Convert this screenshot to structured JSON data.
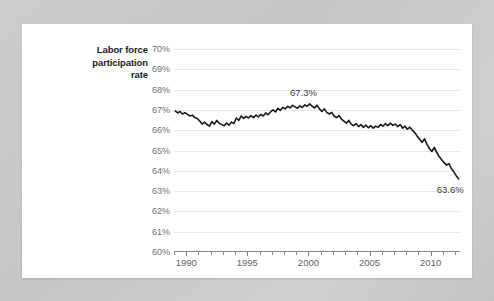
{
  "card": {
    "background_color": "#ffffff",
    "page_background_color": "#c9c9c9"
  },
  "chart_data": {
    "type": "line",
    "title": "Labor force participation rate",
    "title_lines": [
      "Labor force",
      "participation",
      "rate"
    ],
    "xlabel": "",
    "ylabel": "",
    "xlim": [
      1989.0,
      2012.4
    ],
    "ylim": [
      60,
      70
    ],
    "grid": true,
    "legend": "none",
    "line_color": "#1a1a1a",
    "grid_color": "#e9e9e9",
    "axis_color": "#8a8a8a",
    "ytick_labels": [
      "70%",
      "69%",
      "68%",
      "67%",
      "66%",
      "65%",
      "64%",
      "63%",
      "62%",
      "61%",
      "60%"
    ],
    "ytick_values": [
      70,
      69,
      68,
      67,
      66,
      65,
      64,
      63,
      62,
      61,
      60
    ],
    "xtick_labels": [
      "1990",
      "1995",
      "2000",
      "2005",
      "2010"
    ],
    "xtick_values": [
      1990,
      1995,
      2000,
      2005,
      2010
    ],
    "xtick_minor_values": [
      1989,
      1991,
      1992,
      1993,
      1994,
      1996,
      1997,
      1998,
      1999,
      2001,
      2002,
      2003,
      2004,
      2006,
      2007,
      2008,
      2009,
      2011,
      2012
    ],
    "annotations": [
      {
        "name": "peak-label",
        "text": "67.3%",
        "x": 1999.6,
        "y": 67.85
      },
      {
        "name": "end-label",
        "text": "63.6%",
        "x": 2011.6,
        "y": 63.05
      }
    ],
    "series": [
      {
        "name": "Labor force participation rate",
        "x": [
          1989.1,
          1989.3,
          1989.5,
          1989.7,
          1989.9,
          1990.1,
          1990.3,
          1990.5,
          1990.7,
          1990.9,
          1991.1,
          1991.3,
          1991.5,
          1991.7,
          1991.9,
          1992.1,
          1992.3,
          1992.5,
          1992.7,
          1992.9,
          1993.1,
          1993.3,
          1993.5,
          1993.7,
          1993.9,
          1994.1,
          1994.3,
          1994.5,
          1994.7,
          1994.9,
          1995.1,
          1995.3,
          1995.5,
          1995.7,
          1995.9,
          1996.1,
          1996.3,
          1996.5,
          1996.7,
          1996.9,
          1997.1,
          1997.3,
          1997.5,
          1997.7,
          1997.9,
          1998.1,
          1998.3,
          1998.5,
          1998.7,
          1998.9,
          1999.1,
          1999.3,
          1999.5,
          1999.7,
          1999.9,
          2000.1,
          2000.3,
          2000.5,
          2000.7,
          2000.9,
          2001.1,
          2001.3,
          2001.5,
          2001.7,
          2001.9,
          2002.1,
          2002.3,
          2002.5,
          2002.7,
          2002.9,
          2003.1,
          2003.3,
          2003.5,
          2003.7,
          2003.9,
          2004.1,
          2004.3,
          2004.5,
          2004.7,
          2004.9,
          2005.1,
          2005.3,
          2005.5,
          2005.7,
          2005.9,
          2006.1,
          2006.3,
          2006.5,
          2006.7,
          2006.9,
          2007.1,
          2007.3,
          2007.5,
          2007.7,
          2007.9,
          2008.1,
          2008.3,
          2008.5,
          2008.7,
          2008.9,
          2009.1,
          2009.3,
          2009.5,
          2009.7,
          2009.9,
          2010.1,
          2010.3,
          2010.5,
          2010.7,
          2010.9,
          2011.1,
          2011.3,
          2011.5,
          2011.7,
          2011.9,
          2012.1,
          2012.3
        ],
        "y": [
          66.95,
          66.85,
          66.92,
          66.8,
          66.86,
          66.78,
          66.7,
          66.74,
          66.62,
          66.58,
          66.45,
          66.3,
          66.4,
          66.28,
          66.2,
          66.42,
          66.3,
          66.48,
          66.35,
          66.28,
          66.22,
          66.35,
          66.25,
          66.4,
          66.33,
          66.6,
          66.48,
          66.7,
          66.58,
          66.68,
          66.6,
          66.72,
          66.62,
          66.75,
          66.65,
          66.78,
          66.7,
          66.85,
          66.76,
          66.9,
          67.0,
          66.9,
          67.08,
          66.98,
          67.12,
          67.05,
          67.18,
          67.1,
          67.22,
          67.15,
          67.08,
          67.2,
          67.12,
          67.25,
          67.18,
          67.3,
          67.18,
          67.1,
          67.22,
          67.05,
          66.92,
          67.05,
          66.88,
          66.8,
          66.88,
          66.7,
          66.62,
          66.72,
          66.55,
          66.45,
          66.35,
          66.48,
          66.3,
          66.22,
          66.32,
          66.18,
          66.28,
          66.14,
          66.25,
          66.12,
          66.22,
          66.1,
          66.2,
          66.14,
          66.28,
          66.2,
          66.32,
          66.22,
          66.35,
          66.24,
          66.3,
          66.18,
          66.28,
          66.1,
          66.2,
          66.05,
          66.15,
          66.0,
          65.88,
          65.7,
          65.55,
          65.4,
          65.58,
          65.3,
          65.1,
          64.95,
          65.15,
          64.9,
          64.7,
          64.55,
          64.4,
          64.28,
          64.35,
          64.1,
          63.95,
          63.75,
          63.6
        ]
      }
    ]
  }
}
